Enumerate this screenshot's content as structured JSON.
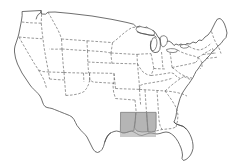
{
  "figure": {
    "kind": "choropleth-outline-map",
    "title": "United States outline map with highlighted Gulf Coast region",
    "width_px": 236,
    "height_px": 166
  },
  "colors": {
    "background": "#ffffff",
    "coast_outline": "#4a4a4a",
    "state_border": "#6b6b6b",
    "lake_outline": "#5a5a5a",
    "highlight_fill": "#a9a9a9",
    "highlight_state_fill": "#9c9c9c"
  },
  "map": {
    "projection_note": "conic, contiguous 48 states",
    "national_border_style": "solid",
    "state_border_style": "dashed",
    "regions_shown": [
      "West",
      "Southwest",
      "Great Plains",
      "Midwest",
      "Great Lakes",
      "Northeast",
      "South",
      "Gulf Coast",
      "Florida Peninsula"
    ],
    "water_features": [
      "Lake Superior",
      "Lake Michigan",
      "Lake Huron",
      "Lake Erie",
      "Lake Ontario",
      "Gulf of Mexico",
      "Atlantic Ocean",
      "Pacific Ocean"
    ]
  },
  "highlight": {
    "label": "Gulf Coast highlight",
    "shape": "rectangle",
    "x_px": 120,
    "y_px": 112,
    "width_px": 36,
    "height_px": 25,
    "fill": "#a9a9a9",
    "opacity": 0.62,
    "states_covered": [
      "Louisiana",
      "Mississippi",
      "Alabama"
    ]
  },
  "legend": {
    "visible": false,
    "entries": []
  },
  "labels": {
    "visible": false,
    "state_names_shown": false,
    "title_shown": false
  }
}
